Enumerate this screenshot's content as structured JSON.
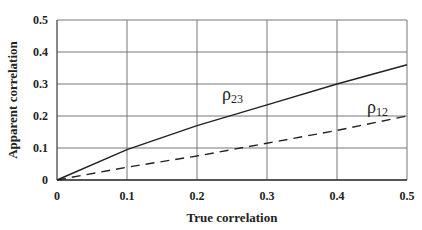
{
  "chart_data": {
    "type": "line",
    "title": "",
    "xlabel": "True correlation",
    "ylabel": "Apparent correlation",
    "xlim": [
      0,
      0.5
    ],
    "ylim": [
      0,
      0.5
    ],
    "x_ticks": [
      "0",
      "0.1",
      "0.2",
      "0.3",
      "0.4",
      "0.5"
    ],
    "y_ticks": [
      "0",
      "0.1",
      "0.2",
      "0.3",
      "0.4",
      "0.5"
    ],
    "grid": true,
    "x": [
      0,
      0.1,
      0.2,
      0.3,
      0.4,
      0.5
    ],
    "series": [
      {
        "name": "ρ23",
        "label_main": "ρ",
        "label_sub": "23",
        "style": "solid",
        "values": [
          0,
          0.095,
          0.17,
          0.235,
          0.3,
          0.36
        ]
      },
      {
        "name": "ρ12",
        "label_main": "ρ",
        "label_sub": "12",
        "style": "dashed",
        "values": [
          0,
          0.04,
          0.075,
          0.115,
          0.155,
          0.2
        ]
      }
    ]
  }
}
